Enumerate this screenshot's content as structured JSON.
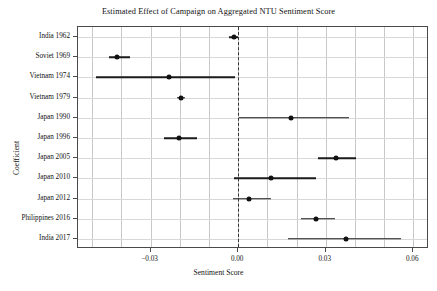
{
  "chart_data": {
    "type": "scatter",
    "title": "Estimated Effect of Campaign on Aggregated NTU Sentiment Score",
    "xlabel": "Sentiment Score",
    "ylabel": "Coefficient",
    "xlim": [
      -0.0549,
      0.0654
    ],
    "xticks": [
      -0.03,
      0.0,
      0.03,
      0.06
    ],
    "xticklabels": [
      "−0.03",
      "0.00",
      "0.03",
      "0.06"
    ],
    "grid": true,
    "legend": null,
    "reference_line": 0.0,
    "categories": [
      "India 1962",
      "Soviet 1969",
      "Vietnam 1974",
      "Vietnam 1979",
      "Japan 1990",
      "Japan 1996",
      "Japan 2005",
      "Japan 2010",
      "Japan 2012",
      "Philippines 2016",
      "India 2017"
    ],
    "values": [
      -0.0016,
      -0.0415,
      -0.0237,
      -0.0195,
      0.0182,
      -0.0202,
      0.0336,
      0.0113,
      0.0038,
      0.0267,
      0.037
    ],
    "ci_low": [
      -0.0031,
      -0.0442,
      -0.0487,
      -0.0209,
      0.0003,
      -0.0254,
      0.0274,
      -0.0014,
      -0.0017,
      0.0216,
      0.0171
    ],
    "ci_high": [
      0.0,
      -0.037,
      -0.001,
      -0.0182,
      0.0381,
      -0.0141,
      0.0404,
      0.0267,
      0.0113,
      0.0333,
      0.0559
    ],
    "points": [
      {
        "label": "India 1962",
        "value": -0.0016,
        "ci_low": -0.0031,
        "ci_high": 0.0
      },
      {
        "label": "Soviet 1969",
        "value": -0.0415,
        "ci_low": -0.0442,
        "ci_high": -0.037
      },
      {
        "label": "Vietnam 1974",
        "value": -0.0237,
        "ci_low": -0.0487,
        "ci_high": -0.001
      },
      {
        "label": "Vietnam 1979",
        "value": -0.0195,
        "ci_low": -0.0209,
        "ci_high": -0.0182
      },
      {
        "label": "Japan 1990",
        "value": 0.0182,
        "ci_low": 0.0003,
        "ci_high": 0.0381
      },
      {
        "label": "Japan 1996",
        "value": -0.0202,
        "ci_low": -0.0254,
        "ci_high": -0.0141
      },
      {
        "label": "Japan 2005",
        "value": 0.0336,
        "ci_low": 0.0274,
        "ci_high": 0.0404
      },
      {
        "label": "Japan 2010",
        "value": 0.0113,
        "ci_low": -0.0014,
        "ci_high": 0.0267
      },
      {
        "label": "Japan 2012",
        "value": 0.0038,
        "ci_low": -0.0017,
        "ci_high": 0.0113
      },
      {
        "label": "Philippines 2016",
        "value": 0.0267,
        "ci_low": 0.0216,
        "ci_high": 0.0333
      },
      {
        "label": "India 2017",
        "value": 0.037,
        "ci_low": 0.0171,
        "ci_high": 0.0559
      }
    ],
    "marker_color": "#111111",
    "line_color": "#1b1b1b",
    "reference_line_color": "#333333"
  }
}
